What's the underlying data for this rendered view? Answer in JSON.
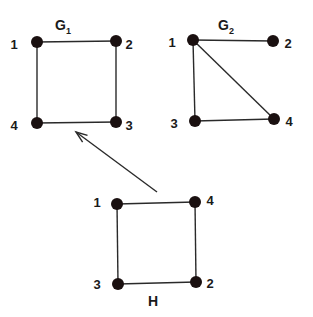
{
  "diagram": {
    "graphs": [
      {
        "id": "G1",
        "title": "G",
        "subscript": "1",
        "title_pos": [
          63,
          30
        ],
        "nodes": [
          {
            "id": "1",
            "label": "1",
            "x": 37,
            "y": 42,
            "lx": 14,
            "ly": 46
          },
          {
            "id": "2",
            "label": "2",
            "x": 116,
            "y": 41,
            "lx": 129,
            "ly": 46
          },
          {
            "id": "3",
            "label": "3",
            "x": 116,
            "y": 122,
            "lx": 129,
            "ly": 127
          },
          {
            "id": "4",
            "label": "4",
            "x": 37,
            "y": 123,
            "lx": 14,
            "ly": 127
          }
        ],
        "edges": [
          [
            "1",
            "2"
          ],
          [
            "2",
            "3"
          ],
          [
            "3",
            "4"
          ],
          [
            "4",
            "1"
          ]
        ]
      },
      {
        "id": "G2",
        "title": "G",
        "subscript": "2",
        "title_pos": [
          226,
          30
        ],
        "nodes": [
          {
            "id": "1",
            "label": "1",
            "x": 193,
            "y": 40,
            "lx": 172,
            "ly": 44
          },
          {
            "id": "2",
            "label": "2",
            "x": 273,
            "y": 41,
            "lx": 288,
            "ly": 45
          },
          {
            "id": "3",
            "label": "3",
            "x": 195,
            "y": 121,
            "lx": 174,
            "ly": 125
          },
          {
            "id": "4",
            "label": "4",
            "x": 274,
            "y": 119,
            "lx": 289,
            "ly": 123
          }
        ],
        "edges": [
          [
            "1",
            "2"
          ],
          [
            "1",
            "3"
          ],
          [
            "1",
            "4"
          ],
          [
            "3",
            "4"
          ]
        ]
      },
      {
        "id": "H",
        "title": "H",
        "subscript": "",
        "title_pos": [
          153,
          306
        ],
        "nodes": [
          {
            "id": "1",
            "label": "1",
            "x": 117,
            "y": 204,
            "lx": 97,
            "ly": 204
          },
          {
            "id": "4",
            "label": "4",
            "x": 195,
            "y": 202,
            "lx": 210,
            "ly": 202
          },
          {
            "id": "3",
            "label": "3",
            "x": 118,
            "y": 284,
            "lx": 97,
            "ly": 286
          },
          {
            "id": "2",
            "label": "2",
            "x": 196,
            "y": 282,
            "lx": 210,
            "ly": 285
          }
        ],
        "edges": [
          [
            "1",
            "4"
          ],
          [
            "4",
            "2"
          ],
          [
            "2",
            "3"
          ],
          [
            "3",
            "1"
          ]
        ]
      }
    ],
    "arrow": {
      "from": [
        157,
        192
      ],
      "to": [
        76,
        132
      ],
      "meaning": "H maps to G1"
    }
  }
}
